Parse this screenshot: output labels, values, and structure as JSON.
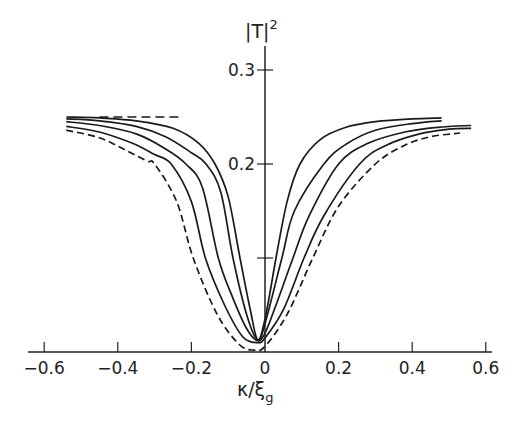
{
  "chart_data": {
    "type": "line",
    "title": "",
    "xlabel": "κ/ξ",
    "xlabel_subscript": "g",
    "ylabel": "|T|",
    "ylabel_superscript": "2",
    "xlim": [
      -0.63,
      0.62
    ],
    "ylim": [
      0,
      0.31
    ],
    "x_ticks": [
      -0.6,
      -0.4,
      -0.2,
      0,
      0.2,
      0.4,
      0.6
    ],
    "x_tick_labels": [
      "-0.6",
      "-0.4",
      "-0.2",
      "0",
      "0.2",
      "0.4",
      "0.6"
    ],
    "y_ticks": [
      0.1,
      0.2,
      0.3
    ],
    "y_tick_labels": [
      "",
      "0.2",
      "0.3"
    ],
    "grid": false,
    "legend": null,
    "annotations": [
      {
        "type": "dashed-asymptote",
        "y": 0.25,
        "x_range": [
          -0.45,
          -0.23
        ]
      }
    ],
    "series": [
      {
        "name": "curve-1",
        "style": "solid",
        "x": [
          -0.54,
          -0.45,
          -0.35,
          -0.25,
          -0.18,
          -0.136,
          -0.1,
          -0.068,
          -0.04,
          -0.02,
          0.0,
          0.03,
          0.06,
          0.095,
          0.15,
          0.22,
          0.3,
          0.4,
          0.48
        ],
        "y": [
          0.25,
          0.249,
          0.246,
          0.238,
          0.222,
          0.2,
          0.165,
          0.1,
          0.045,
          0.013,
          0.035,
          0.1,
          0.16,
          0.2,
          0.226,
          0.239,
          0.245,
          0.248,
          0.249
        ]
      },
      {
        "name": "curve-2",
        "style": "solid",
        "x": [
          -0.54,
          -0.45,
          -0.35,
          -0.27,
          -0.2,
          -0.16,
          -0.12,
          -0.087,
          -0.05,
          -0.02,
          0.0,
          0.046,
          0.08,
          0.16,
          0.22,
          0.3,
          0.4,
          0.48
        ],
        "y": [
          0.248,
          0.246,
          0.24,
          0.229,
          0.212,
          0.2,
          0.17,
          0.1,
          0.04,
          0.013,
          0.03,
          0.1,
          0.15,
          0.2,
          0.221,
          0.236,
          0.243,
          0.246
        ]
      },
      {
        "name": "curve-3",
        "style": "solid",
        "x": [
          -0.54,
          -0.45,
          -0.35,
          -0.27,
          -0.215,
          -0.17,
          -0.127,
          -0.09,
          -0.05,
          -0.02,
          0.0,
          0.03,
          0.076,
          0.12,
          0.2,
          0.28,
          0.38,
          0.47,
          0.56
        ],
        "y": [
          0.245,
          0.241,
          0.232,
          0.216,
          0.2,
          0.175,
          0.1,
          0.06,
          0.025,
          0.012,
          0.02,
          0.05,
          0.1,
          0.145,
          0.2,
          0.222,
          0.234,
          0.239,
          0.241
        ]
      },
      {
        "name": "curve-4",
        "style": "solid",
        "x": [
          -0.54,
          -0.45,
          -0.36,
          -0.3,
          -0.255,
          -0.2,
          -0.162,
          -0.11,
          -0.06,
          -0.02,
          0.0,
          0.05,
          0.106,
          0.16,
          0.257,
          0.33,
          0.42,
          0.5,
          0.56
        ],
        "y": [
          0.24,
          0.234,
          0.222,
          0.21,
          0.2,
          0.16,
          0.1,
          0.05,
          0.016,
          0.01,
          0.015,
          0.045,
          0.1,
          0.145,
          0.2,
          0.22,
          0.232,
          0.237,
          0.238
        ]
      },
      {
        "name": "curve-dashed",
        "style": "dashed",
        "x": [
          -0.54,
          -0.45,
          -0.38,
          -0.32,
          -0.3,
          -0.24,
          -0.195,
          -0.13,
          -0.07,
          -0.03,
          0.0,
          0.06,
          0.13,
          0.2,
          0.3,
          0.38,
          0.45,
          0.53
        ],
        "y": [
          0.236,
          0.228,
          0.215,
          0.203,
          0.2,
          0.16,
          0.1,
          0.04,
          0.008,
          0.002,
          0.006,
          0.04,
          0.1,
          0.155,
          0.2,
          0.22,
          0.229,
          0.233
        ]
      }
    ]
  }
}
